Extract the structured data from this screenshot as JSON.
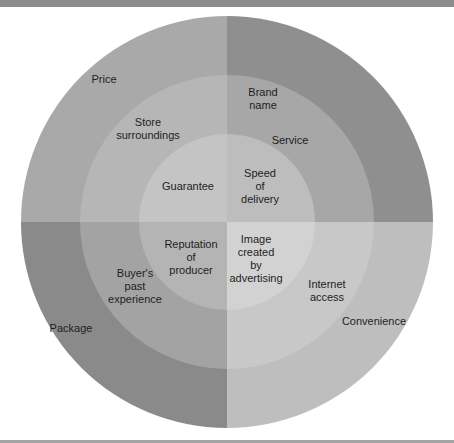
{
  "diagram": {
    "type": "concentric-quadrant-circle",
    "center": {
      "x": 227,
      "y": 222
    },
    "radii": {
      "outer": 206,
      "middle": 147,
      "inner": 88
    },
    "colors": {
      "top_left": {
        "outer": "#a9a9a9",
        "middle": "#b6b6b6",
        "inner": "#c4c4c4"
      },
      "top_right": {
        "outer": "#8f8f8f",
        "middle": "#a7a7a7",
        "inner": "#bdbdbd"
      },
      "bottom_left": {
        "outer": "#8a8a8a",
        "middle": "#a3a3a3",
        "inner": "#b4b4b4"
      },
      "bottom_right": {
        "outer": "#bebebe",
        "middle": "#c8c8c8",
        "inner": "#d2d2d2"
      },
      "top_bar": "#8c8c8c",
      "bottom_bar": "#a4a4a4"
    },
    "quadrants": {
      "top_left": {
        "outer": {
          "label": [
            "Price"
          ],
          "x": 104,
          "y": 79
        },
        "middle": {
          "label": [
            "Store",
            "surroundings"
          ],
          "x": 148,
          "y": 128
        },
        "inner": {
          "label": [
            "Guarantee"
          ],
          "x": 188,
          "y": 186
        }
      },
      "top_right": {
        "outer": {
          "label": [
            "Brand",
            "name"
          ],
          "x": 263,
          "y": 98
        },
        "middle": {
          "label": [
            "Service"
          ],
          "x": 290,
          "y": 140
        },
        "inner": {
          "label": [
            "Speed",
            "of",
            "delivery"
          ],
          "x": 260,
          "y": 186
        }
      },
      "bottom_left": {
        "outer": {
          "label": [
            "Package"
          ],
          "x": 71,
          "y": 328
        },
        "middle": {
          "label": [
            "Buyer's",
            "past",
            "experience"
          ],
          "x": 135,
          "y": 286
        },
        "inner": {
          "label": [
            "Reputation",
            "of",
            "producer"
          ],
          "x": 191,
          "y": 257
        }
      },
      "bottom_right": {
        "outer": {
          "label": [
            "Convenience"
          ],
          "x": 374,
          "y": 321
        },
        "middle": {
          "label": [
            "Internet",
            "access"
          ],
          "x": 327,
          "y": 290
        },
        "inner": {
          "label": [
            "Image",
            "created",
            "by",
            "advertising"
          ],
          "x": 256,
          "y": 258
        }
      }
    }
  }
}
